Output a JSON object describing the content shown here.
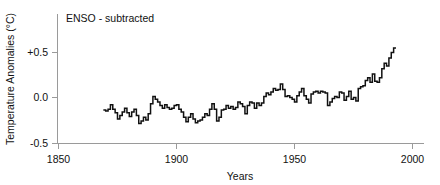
{
  "chart_data": {
    "type": "line",
    "title": "ENSO - subtracted",
    "xlabel": "Years",
    "ylabel": "Temperature Anomalies (°C)",
    "xlim": [
      1850,
      2005
    ],
    "ylim": [
      -0.5,
      0.65
    ],
    "grid": false,
    "legend": "none",
    "xticks": [
      1850,
      1900,
      1950,
      2000
    ],
    "xtick_labels": [
      "1850",
      "1900",
      "1950",
      "2000"
    ],
    "yticks": [
      -0.5,
      0.0,
      0.5
    ],
    "ytick_labels": [
      "-0.5",
      "0.0",
      "+0.5"
    ],
    "line_color": "#111111",
    "axis_color": "#9a9a9a",
    "series": [
      {
        "name": "Temperature anomaly (ENSO subtracted)",
        "x": [
          1869,
          1870,
          1871,
          1872,
          1873,
          1874,
          1875,
          1876,
          1877,
          1878,
          1879,
          1880,
          1881,
          1882,
          1883,
          1884,
          1885,
          1886,
          1887,
          1888,
          1889,
          1890,
          1891,
          1892,
          1893,
          1894,
          1895,
          1896,
          1897,
          1898,
          1899,
          1900,
          1901,
          1902,
          1903,
          1904,
          1905,
          1906,
          1907,
          1908,
          1909,
          1910,
          1911,
          1912,
          1913,
          1914,
          1915,
          1916,
          1917,
          1918,
          1919,
          1920,
          1921,
          1922,
          1923,
          1924,
          1925,
          1926,
          1927,
          1928,
          1929,
          1930,
          1931,
          1932,
          1933,
          1934,
          1935,
          1936,
          1937,
          1938,
          1939,
          1940,
          1941,
          1942,
          1943,
          1944,
          1945,
          1946,
          1947,
          1948,
          1949,
          1950,
          1951,
          1952,
          1953,
          1954,
          1955,
          1956,
          1957,
          1958,
          1959,
          1960,
          1961,
          1962,
          1963,
          1964,
          1965,
          1966,
          1967,
          1968,
          1969,
          1970,
          1971,
          1972,
          1973,
          1974,
          1975,
          1976,
          1977,
          1978,
          1979,
          1980,
          1981,
          1982,
          1983,
          1984,
          1985,
          1986,
          1987,
          1988,
          1989,
          1990,
          1991,
          1992
        ],
        "values": [
          -0.14,
          -0.15,
          -0.13,
          -0.08,
          -0.13,
          -0.17,
          -0.24,
          -0.2,
          -0.16,
          -0.12,
          -0.17,
          -0.21,
          -0.16,
          -0.13,
          -0.2,
          -0.29,
          -0.26,
          -0.22,
          -0.25,
          -0.18,
          -0.07,
          0.01,
          -0.02,
          -0.05,
          -0.09,
          -0.12,
          -0.08,
          -0.11,
          -0.13,
          -0.12,
          -0.09,
          -0.08,
          -0.13,
          -0.16,
          -0.22,
          -0.27,
          -0.22,
          -0.18,
          -0.24,
          -0.28,
          -0.26,
          -0.25,
          -0.22,
          -0.18,
          -0.2,
          -0.13,
          -0.07,
          -0.13,
          -0.26,
          -0.22,
          -0.14,
          -0.13,
          -0.09,
          -0.12,
          -0.1,
          -0.13,
          -0.11,
          -0.05,
          -0.07,
          -0.1,
          -0.18,
          -0.09,
          -0.05,
          -0.06,
          -0.12,
          -0.06,
          -0.09,
          -0.06,
          0.01,
          0.05,
          0.03,
          0.06,
          0.1,
          0.08,
          0.09,
          0.15,
          0.09,
          0.01,
          0.02,
          0.0,
          -0.02,
          -0.05,
          0.02,
          0.06,
          0.1,
          0.02,
          -0.02,
          -0.06,
          0.04,
          0.06,
          0.07,
          0.05,
          0.07,
          0.06,
          0.05,
          -0.09,
          -0.05,
          -0.01,
          0.01,
          0.0,
          0.06,
          0.05,
          -0.03,
          0.01,
          0.07,
          -0.02,
          0.0,
          -0.04,
          0.1,
          0.12,
          0.13,
          0.19,
          0.22,
          0.17,
          0.26,
          0.18,
          0.17,
          0.22,
          0.32,
          0.38,
          0.35,
          0.44,
          0.5,
          0.55
        ]
      }
    ]
  }
}
